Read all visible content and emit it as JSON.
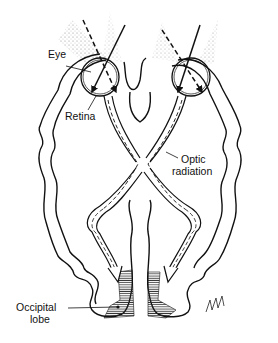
{
  "labels": {
    "eye": "Eye",
    "retina": "Retina",
    "optic_radiation_line1": "Optic",
    "optic_radiation_line2": "radiation",
    "occipital_line1": "Occipital",
    "occipital_line2": "lobe"
  },
  "colors": {
    "ink": "#111111",
    "background": "#ffffff"
  }
}
